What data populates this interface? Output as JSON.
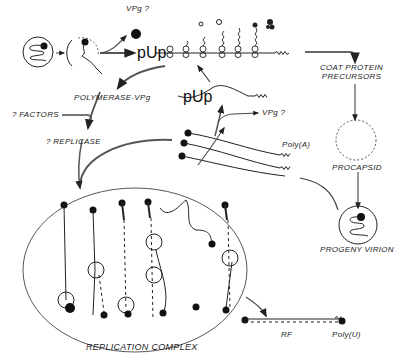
{
  "labels": {
    "vpg_top": "VPg ?",
    "pup_main": "pUp",
    "pup_second": "pUp",
    "vpg_mid": "VPg ?",
    "coat_protein_line1": "COAT  PROTEIN",
    "coat_protein_line2": "PRECURSORS",
    "polymerase_vpg": "POLYMERASE-VPg",
    "factors": "? FACTORS",
    "replicase": "? REPLICASE",
    "poly_a": "Poly(A)",
    "procapsid": "PROCAPSID",
    "progeny_virion": "PROGENY  VIRION",
    "replication_complex": "REPLICATION COMPLEX",
    "rf": "RF",
    "poly_u": "Poly(U)"
  },
  "colors": {
    "ink": "#1a1a1a",
    "arrow": "#555555",
    "background": "#ffffff"
  }
}
